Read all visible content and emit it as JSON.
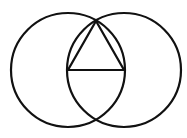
{
  "diagram": {
    "title": "",
    "stroke_color": "#111111",
    "background": "#ffffff",
    "circles": [
      {
        "name": "left-circle",
        "cx": 68,
        "cy": 70,
        "r": 57
      },
      {
        "name": "right-circle",
        "cx": 124,
        "cy": 70,
        "r": 57
      }
    ],
    "triangle": {
      "points": [
        [
          68,
          70
        ],
        [
          124,
          70
        ],
        [
          96,
          21
        ]
      ]
    },
    "labels": []
  }
}
